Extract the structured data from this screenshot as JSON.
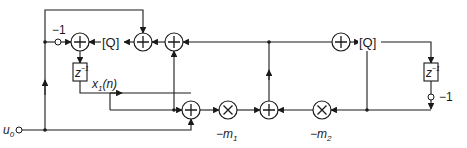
{
  "diagram": {
    "title": "",
    "colors": {
      "line": "#1a1a1a",
      "background": "#ffffff"
    },
    "labels": {
      "neg_one_left": "−1",
      "neg_one_right": "−1",
      "quantizer_left": "[Q]",
      "quantizer_right": "[Q]",
      "delay_left_base": "z",
      "delay_left_exp": "−1",
      "delay_right_base": "z",
      "delay_right_exp": "−1",
      "state_var": "x",
      "state_var_sub": "1",
      "state_var_arg": "(n)",
      "input_base": "u",
      "input_sub": "0",
      "mult1_base": "−m",
      "mult1_sub": "1",
      "mult2_base": "−m",
      "mult2_sub": "2"
    },
    "nodes": [
      {
        "id": "adder-left",
        "type": "adder"
      },
      {
        "id": "adder-top-center",
        "type": "adder"
      },
      {
        "id": "adder-top-right",
        "type": "adder"
      },
      {
        "id": "adder-far-right",
        "type": "adder"
      },
      {
        "id": "adder-bottom-left",
        "type": "adder"
      },
      {
        "id": "adder-bottom-right",
        "type": "adder"
      },
      {
        "id": "multiplier-m1",
        "type": "multiplier"
      },
      {
        "id": "multiplier-m2",
        "type": "multiplier"
      },
      {
        "id": "quantizer-left",
        "type": "quantizer"
      },
      {
        "id": "quantizer-right",
        "type": "quantizer"
      },
      {
        "id": "delay-left",
        "type": "delay"
      },
      {
        "id": "delay-right",
        "type": "delay"
      },
      {
        "id": "gain-neg1-left",
        "type": "gain"
      },
      {
        "id": "gain-neg1-right",
        "type": "gain"
      },
      {
        "id": "input-u0",
        "type": "input"
      }
    ]
  }
}
